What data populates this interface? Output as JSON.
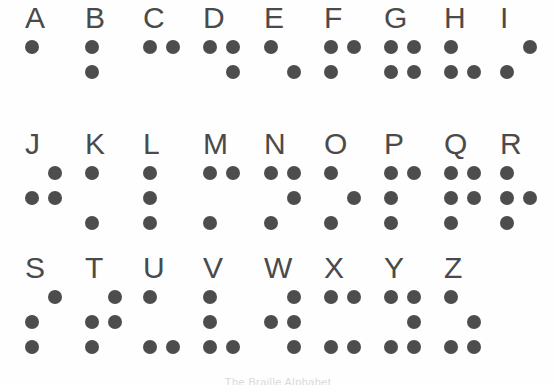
{
  "caption": "The Braille Alphabet",
  "colors": {
    "dot": "#4d4d4d",
    "letter": "#4a4a4a",
    "background": "#fefefe"
  },
  "layout": {
    "columns_per_row": 9,
    "column_pitch_px": 60,
    "dot_diameter_px": 14
  },
  "legend": {
    "dot_positions": [
      "1 top-left",
      "2 middle-left",
      "3 bottom-left",
      "4 top-right",
      "5 middle-right",
      "6 bottom-right"
    ]
  },
  "rows": [
    {
      "index": 0,
      "cells": [
        {
          "letter": "A",
          "dots": [
            1
          ],
          "x": 25
        },
        {
          "letter": "B",
          "dots": [
            1,
            2
          ],
          "x": 85
        },
        {
          "letter": "C",
          "dots": [
            1,
            4
          ],
          "x": 143
        },
        {
          "letter": "D",
          "dots": [
            1,
            4,
            5
          ],
          "x": 203
        },
        {
          "letter": "E",
          "dots": [
            1,
            5
          ],
          "x": 264
        },
        {
          "letter": "F",
          "dots": [
            1,
            4,
            2
          ],
          "x": 324
        },
        {
          "letter": "G",
          "dots": [
            1,
            4,
            2,
            5
          ],
          "x": 384
        },
        {
          "letter": "H",
          "dots": [
            1,
            2,
            5
          ],
          "x": 444
        },
        {
          "letter": "I",
          "dots": [
            4,
            2
          ],
          "x": 500
        }
      ]
    },
    {
      "index": 1,
      "cells": [
        {
          "letter": "J",
          "dots": [
            4,
            2,
            5
          ],
          "x": 25
        },
        {
          "letter": "K",
          "dots": [
            1,
            3
          ],
          "x": 85
        },
        {
          "letter": "L",
          "dots": [
            1,
            2,
            3
          ],
          "x": 143
        },
        {
          "letter": "M",
          "dots": [
            1,
            4,
            3
          ],
          "x": 203
        },
        {
          "letter": "N",
          "dots": [
            1,
            4,
            5,
            3
          ],
          "x": 264
        },
        {
          "letter": "O",
          "dots": [
            1,
            5,
            3
          ],
          "x": 324
        },
        {
          "letter": "P",
          "dots": [
            1,
            4,
            2,
            3
          ],
          "x": 384
        },
        {
          "letter": "Q",
          "dots": [
            1,
            4,
            2,
            5,
            3
          ],
          "x": 444
        },
        {
          "letter": "R",
          "dots": [
            1,
            2,
            5,
            3
          ],
          "x": 500
        }
      ]
    },
    {
      "index": 2,
      "cells": [
        {
          "letter": "S",
          "dots": [
            4,
            2,
            3
          ],
          "x": 25
        },
        {
          "letter": "T",
          "dots": [
            4,
            2,
            5,
            3
          ],
          "x": 85
        },
        {
          "letter": "U",
          "dots": [
            1,
            3,
            6
          ],
          "x": 143
        },
        {
          "letter": "V",
          "dots": [
            1,
            2,
            3,
            6
          ],
          "x": 203
        },
        {
          "letter": "W",
          "dots": [
            4,
            2,
            5,
            6
          ],
          "x": 264
        },
        {
          "letter": "X",
          "dots": [
            1,
            4,
            3,
            6
          ],
          "x": 324
        },
        {
          "letter": "Y",
          "dots": [
            1,
            4,
            5,
            3,
            6
          ],
          "x": 384
        },
        {
          "letter": "Z",
          "dots": [
            1,
            5,
            3,
            6
          ],
          "x": 444
        }
      ]
    }
  ]
}
